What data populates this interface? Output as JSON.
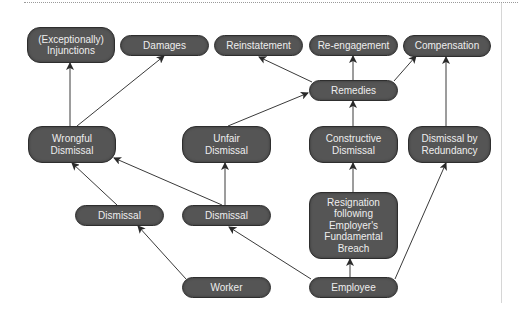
{
  "diagram": {
    "colors": {
      "node_fill": "#555555",
      "node_text": "#eeeeee",
      "edge": "#3a3a3a",
      "background": "#ffffff"
    },
    "nodes": {
      "injunctions": "(Exceptionally)\nInjunctions",
      "damages": "Damages",
      "reinstatement": "Reinstatement",
      "reengagement": "Re-engagement",
      "compensation": "Compensation",
      "remedies": "Remedies",
      "wrongful_dismissal": "Wrongful\nDismissal",
      "unfair_dismissal": "Unfair\nDismissal",
      "constructive_dismissal": "Constructive\nDismissal",
      "dismissal_by_redundancy": "Dismissal by\nRedundancy",
      "dismissal_left": "Dismissal",
      "dismissal_right": "Dismissal",
      "resignation": "Resignation\nfollowing\nEmployer's\nFundamental\nBreach",
      "worker": "Worker",
      "employee": "Employee"
    },
    "edges": [
      {
        "from": "Worker",
        "to": "Dismissal (left)"
      },
      {
        "from": "Employee",
        "to": "Dismissal (right)"
      },
      {
        "from": "Employee",
        "to": "Resignation following Employer's Fundamental Breach"
      },
      {
        "from": "Employee",
        "to": "Dismissal by Redundancy"
      },
      {
        "from": "Dismissal (left)",
        "to": "Wrongful Dismissal"
      },
      {
        "from": "Dismissal (right)",
        "to": "Wrongful Dismissal"
      },
      {
        "from": "Dismissal (right)",
        "to": "Unfair Dismissal"
      },
      {
        "from": "Resignation following Employer's Fundamental Breach",
        "to": "Constructive Dismissal"
      },
      {
        "from": "Wrongful Dismissal",
        "to": "(Exceptionally) Injunctions"
      },
      {
        "from": "Wrongful Dismissal",
        "to": "Damages"
      },
      {
        "from": "Unfair Dismissal",
        "to": "Remedies"
      },
      {
        "from": "Constructive Dismissal",
        "to": "Remedies"
      },
      {
        "from": "Remedies",
        "to": "Reinstatement"
      },
      {
        "from": "Remedies",
        "to": "Re-engagement"
      },
      {
        "from": "Remedies",
        "to": "Compensation"
      },
      {
        "from": "Dismissal by Redundancy",
        "to": "Compensation"
      }
    ]
  }
}
